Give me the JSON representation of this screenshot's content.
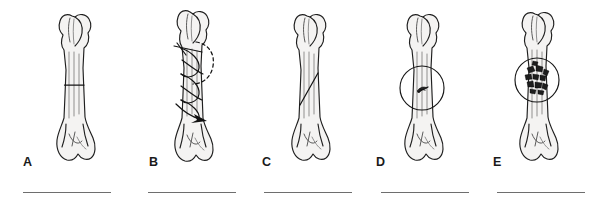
{
  "figure": {
    "background_color": "#ffffff",
    "ink_color": "#1f1f1f",
    "rule_color": "#6e6e6e",
    "bone_fill_color": "#f4f3f2",
    "panel_count": 5
  },
  "panels": [
    {
      "label": "A",
      "icon": "bone-transverse-fracture-icon",
      "fracture_type": "transverse",
      "has_detail_circle": false,
      "has_arrow": false
    },
    {
      "label": "B",
      "icon": "bone-spiral-fracture-icon",
      "fracture_type": "spiral",
      "has_detail_circle": false,
      "has_arrow": true
    },
    {
      "label": "C",
      "icon": "bone-oblique-fracture-icon",
      "fracture_type": "oblique",
      "has_detail_circle": false,
      "has_arrow": false
    },
    {
      "label": "D",
      "icon": "bone-fissure-fracture-icon",
      "fracture_type": "fissure",
      "has_detail_circle": true,
      "has_arrow": false
    },
    {
      "label": "E",
      "icon": "bone-comminuted-fracture-icon",
      "fracture_type": "comminuted",
      "has_detail_circle": true,
      "has_arrow": false
    }
  ],
  "answer_lines": [
    {
      "name": "answer-line-a"
    },
    {
      "name": "answer-line-b"
    },
    {
      "name": "answer-line-c"
    },
    {
      "name": "answer-line-d"
    },
    {
      "name": "answer-line-e"
    }
  ]
}
